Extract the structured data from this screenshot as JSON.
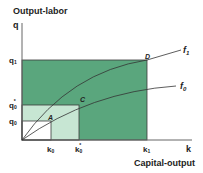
{
  "diagram": {
    "y_axis_title": "Output-labor",
    "y_axis_symbol": "q",
    "x_axis_title": "Capital-output",
    "x_axis_symbol": "k",
    "y_ticks": [
      {
        "label": "q",
        "sub": "1",
        "prime": ""
      },
      {
        "label": "q",
        "sub": "0",
        "prime": "*"
      },
      {
        "label": "q",
        "sub": "0",
        "prime": ""
      }
    ],
    "x_ticks": [
      {
        "label": "k",
        "sub": "0",
        "prime": ""
      },
      {
        "label": "k",
        "sub": "0",
        "prime": "*"
      },
      {
        "label": "k",
        "sub": "1",
        "prime": ""
      }
    ],
    "curves": [
      {
        "name": "f",
        "sub": "1"
      },
      {
        "name": "f",
        "sub": "0"
      }
    ],
    "points": [
      "A",
      "C",
      "D"
    ],
    "colors": {
      "dark_green": "#5aa67d",
      "light_green": "#c7e6d3",
      "axis": "#555555",
      "curve": "#333333"
    }
  }
}
